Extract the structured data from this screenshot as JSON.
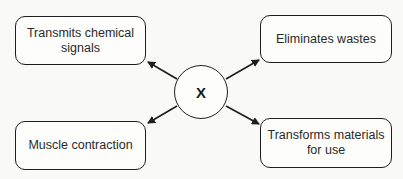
{
  "diagram": {
    "center": {
      "label": "X"
    },
    "boxes": [
      {
        "id": "top-left",
        "label": "Transmits chemical signals"
      },
      {
        "id": "top-right",
        "label": "Eliminates wastes"
      },
      {
        "id": "bottom-left",
        "label": "Muscle contraction"
      },
      {
        "id": "bottom-right",
        "label": "Transforms materials for use"
      }
    ],
    "arrows": [
      {
        "from": "X",
        "to": "Transmits chemical signals"
      },
      {
        "from": "X",
        "to": "Eliminates wastes"
      },
      {
        "from": "X",
        "to": "Muscle contraction"
      },
      {
        "from": "X",
        "to": "Transforms materials for use"
      }
    ],
    "colors": {
      "stroke": "#1e1e1e",
      "background": "#f9f9f8",
      "text": "#2a2a2a"
    }
  }
}
